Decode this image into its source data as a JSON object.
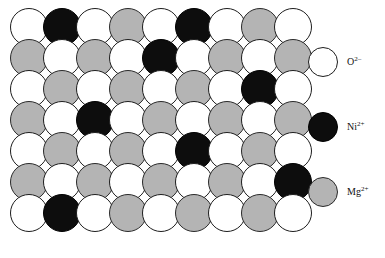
{
  "figure": {
    "background_color": "#ffffff"
  },
  "lattice": {
    "rows": 7,
    "columns": 9,
    "ion_diameter_px": 38,
    "row_pitch_px": 31,
    "column_pitch_px": 33,
    "origin_x_px": 10,
    "origin_y_px": 8,
    "species_colors": {
      "oxide": "#ffffff",
      "nickel": "#0d0d0d",
      "magnesium": "#b4b4b4",
      "outline": "#1d1d1d"
    },
    "grid": [
      [
        "oxide",
        "nickel",
        "oxide",
        "magnesium",
        "oxide",
        "nickel",
        "oxide",
        "magnesium",
        "oxide"
      ],
      [
        "magnesium",
        "oxide",
        "magnesium",
        "oxide",
        "nickel",
        "oxide",
        "magnesium",
        "oxide",
        "magnesium"
      ],
      [
        "oxide",
        "magnesium",
        "oxide",
        "magnesium",
        "oxide",
        "magnesium",
        "oxide",
        "nickel",
        "oxide"
      ],
      [
        "magnesium",
        "oxide",
        "nickel",
        "oxide",
        "magnesium",
        "oxide",
        "magnesium",
        "oxide",
        "magnesium"
      ],
      [
        "oxide",
        "magnesium",
        "oxide",
        "magnesium",
        "oxide",
        "nickel",
        "oxide",
        "magnesium",
        "oxide"
      ],
      [
        "magnesium",
        "oxide",
        "magnesium",
        "oxide",
        "magnesium",
        "oxide",
        "magnesium",
        "oxide",
        "nickel"
      ],
      [
        "oxide",
        "nickel",
        "oxide",
        "magnesium",
        "oxide",
        "magnesium",
        "oxide",
        "magnesium",
        "oxide"
      ]
    ]
  },
  "legend": {
    "entries": [
      {
        "species": "oxide",
        "swatch_class": "oxide",
        "ion": "O",
        "charge_value": "2",
        "charge_sign": "–",
        "label_plain": "O2–",
        "top_px": 45,
        "color": "#ffffff"
      },
      {
        "species": "nickel",
        "swatch_class": "nickel",
        "ion": "Ni",
        "charge_value": "2",
        "charge_sign": "+",
        "label_plain": "Ni2+",
        "top_px": 110,
        "color": "#0d0d0d"
      },
      {
        "species": "magnesium",
        "swatch_class": "magnesium",
        "ion": "Mg",
        "charge_value": "2",
        "charge_sign": "+",
        "label_plain": "Mg2+",
        "top_px": 175,
        "color": "#b4b4b4"
      }
    ]
  }
}
